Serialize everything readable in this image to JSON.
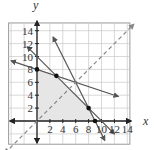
{
  "chart_data": {
    "type": "line",
    "title": "",
    "xlabel": "x",
    "ylabel": "y",
    "xlim": [
      -6,
      16
    ],
    "ylim": [
      -4,
      16
    ],
    "grid": true,
    "x_ticks": [
      2,
      4,
      6,
      8,
      10,
      12,
      14
    ],
    "y_ticks": [
      2,
      4,
      6,
      8,
      10,
      12,
      14
    ],
    "x_tick_labels": [
      "2",
      "4",
      "6",
      "8",
      "10",
      "12",
      "14"
    ],
    "y_tick_labels": [
      "2",
      "4",
      "6",
      "8",
      "10",
      "12",
      "14"
    ],
    "series": [
      {
        "name": "x + 3y = 24",
        "style": "solid",
        "points": [
          [
            -4,
            9.33
          ],
          [
            12.6,
            3.8
          ]
        ]
      },
      {
        "name": "x + y = 10",
        "style": "solid",
        "points": [
          [
            -1.5,
            11.5
          ],
          [
            12,
            -2
          ]
        ]
      },
      {
        "name": "2x + y = 18",
        "style": "solid",
        "points": [
          [
            2.5,
            13
          ],
          [
            10.5,
            -3
          ]
        ]
      },
      {
        "name": "y = x",
        "style": "dashed",
        "points": [
          [
            -5,
            -5
          ],
          [
            15,
            15
          ]
        ]
      }
    ],
    "feasible_region": {
      "vertices": [
        [
          0,
          0
        ],
        [
          0,
          8
        ],
        [
          3,
          7
        ],
        [
          8,
          2
        ],
        [
          9,
          0
        ]
      ],
      "fill": "#e6e6e6"
    },
    "marked_points": [
      [
        0,
        8
      ],
      [
        3,
        7
      ],
      [
        8,
        2
      ],
      [
        9,
        0
      ]
    ],
    "colors": {
      "grid": "#c8c8c8",
      "axis": "#222222",
      "line": "#555555",
      "dashed": "#888888",
      "region": "#e6e6e6",
      "point": "#111111"
    }
  },
  "labels": {
    "x_axis": "x",
    "y_axis": "y"
  }
}
